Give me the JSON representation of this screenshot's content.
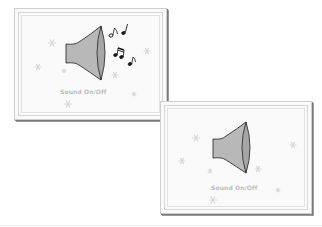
{
  "panels": [
    {
      "id": "sound-on",
      "caption": "Sound On/Off",
      "state": "on",
      "show_music_notes": true
    },
    {
      "id": "sound-off",
      "caption": "Sound On/Off",
      "state": "off",
      "show_music_notes": false
    }
  ],
  "icons": {
    "speaker": "speaker-icon",
    "notes": "music-notes-icon",
    "decoration": "snowflake-icon"
  },
  "colors": {
    "speaker_fill": "#b8b8b8",
    "speaker_cone": "#a6a6a6",
    "speaker_outline": "#333333",
    "note": "#1a1a1a",
    "snowflake": "#d8d8d8",
    "caption": "#bdbdbd",
    "panel_bg": "#fafafa",
    "panel_border": "#8a8a8a"
  }
}
